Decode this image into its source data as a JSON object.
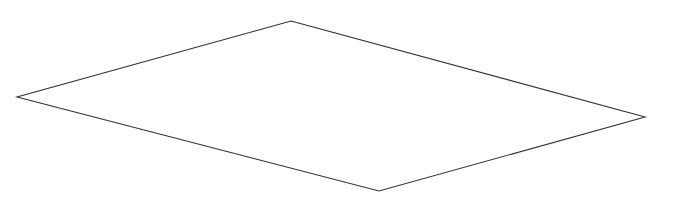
{
  "canvas": {
    "width": 686,
    "height": 204,
    "background_color": "#ffffff"
  },
  "figure": {
    "name": "quadrilateral-outline",
    "type": "line-drawing",
    "stroke_color": "#333333",
    "stroke_width": 1.1,
    "fill": "none",
    "vertex_count": 4,
    "vertices": [
      {
        "label": "top",
        "x": 291,
        "y": 21
      },
      {
        "label": "right",
        "x": 645,
        "y": 117
      },
      {
        "label": "bottom",
        "x": 379,
        "y": 191
      },
      {
        "label": "left",
        "x": 17,
        "y": 97
      }
    ],
    "edges": [
      {
        "label": "top-left-edge",
        "from": "left",
        "to": "top"
      },
      {
        "label": "top-right-edge",
        "from": "top",
        "to": "right"
      },
      {
        "label": "bottom-right-edge",
        "from": "right",
        "to": "bottom"
      },
      {
        "label": "bottom-left-edge",
        "from": "bottom",
        "to": "left"
      }
    ],
    "points_attribute": "291,21 645,117 379,191 17,97"
  }
}
